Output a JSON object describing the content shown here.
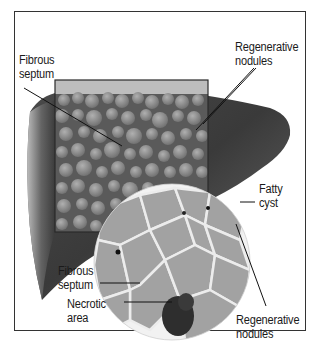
{
  "diagram": {
    "labels": {
      "fibrous_septum_top": [
        "Fibrous",
        "septum"
      ],
      "regenerative_nodules_top": [
        "Regenerative",
        "nodules"
      ],
      "fatty_cyst": [
        "Fatty",
        "cyst"
      ],
      "fibrous_septum_bottom": [
        "Fibrous",
        "septum"
      ],
      "necrotic_area": [
        "Necrotic",
        "area"
      ],
      "regenerative_nodules_bottom": [
        "Regenerative",
        "nodules"
      ]
    },
    "colors": {
      "frame": "#333333",
      "liver_dark": "#3a3a3a",
      "liver_light": "#8a8a8a",
      "nodule": "#9a9a9a",
      "tissue": "#a8a8a8",
      "septum": "#f0f0f0",
      "necrotic": "#2a2a2a",
      "leader_line": "#111111"
    }
  }
}
